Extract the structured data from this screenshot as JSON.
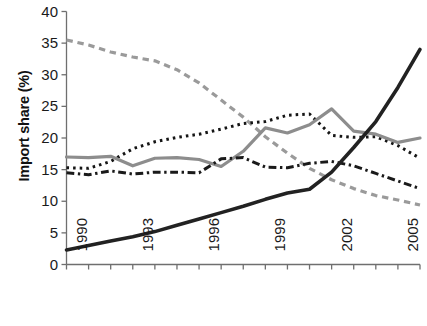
{
  "chart_data": {
    "type": "line",
    "title": "",
    "xlabel": "",
    "ylabel": "Import share (%)",
    "xlim": [
      1990,
      2006
    ],
    "ylim": [
      0,
      40
    ],
    "ytick_values": [
      0,
      5,
      10,
      15,
      20,
      25,
      30,
      35,
      40
    ],
    "ytick_labels": [
      "0",
      "5",
      "10",
      "15",
      "20",
      "25",
      "30",
      "35",
      "40"
    ],
    "xtick_values": [
      1990,
      1993,
      1996,
      1999,
      2002,
      2005
    ],
    "xtick_labels": [
      "1990",
      "1993",
      "1996",
      "1999",
      "2002",
      "2005"
    ],
    "grid": false,
    "legend": "none",
    "x": [
      1990,
      1991,
      1992,
      1993,
      1994,
      1995,
      1996,
      1997,
      1998,
      1999,
      2000,
      2001,
      2002,
      2003,
      2004,
      2005,
      2006
    ],
    "series": [
      {
        "name": "series-gray-dashed",
        "style": "dashed",
        "color": "#9a9a9a",
        "width": 3.2,
        "values": [
          35.5,
          34.7,
          33.6,
          32.8,
          32.2,
          30.8,
          28.7,
          26.0,
          23.3,
          20.2,
          17.6,
          15.2,
          13.4,
          12.0,
          10.9,
          10.2,
          9.4
        ]
      },
      {
        "name": "series-black-dotted",
        "style": "dotted",
        "color": "#151515",
        "width": 3.0,
        "values": [
          15.3,
          15.2,
          16.3,
          18.3,
          19.4,
          20.1,
          20.6,
          21.4,
          22.3,
          22.6,
          23.6,
          23.8,
          20.4,
          20.1,
          20.2,
          18.8,
          16.8
        ]
      },
      {
        "name": "series-gray-solid",
        "style": "solid",
        "color": "#8d8d8d",
        "width": 3.2,
        "values": [
          17.0,
          16.9,
          17.1,
          15.6,
          16.8,
          16.9,
          16.6,
          15.5,
          17.9,
          21.6,
          20.8,
          22.1,
          24.6,
          21.1,
          20.6,
          19.3,
          20.0
        ]
      },
      {
        "name": "series-black-dashdot",
        "style": "dashdot",
        "color": "#1a1a1a",
        "width": 3.0,
        "values": [
          14.5,
          14.2,
          14.8,
          14.3,
          14.6,
          14.6,
          14.5,
          16.7,
          16.9,
          15.4,
          15.3,
          16.0,
          16.3,
          15.6,
          14.4,
          13.2,
          12.0
        ]
      },
      {
        "name": "series-black-solid",
        "style": "solid",
        "color": "#222222",
        "width": 3.6,
        "values": [
          2.3,
          3.0,
          3.7,
          4.4,
          5.2,
          6.2,
          7.2,
          8.2,
          9.2,
          10.3,
          11.3,
          11.9,
          14.6,
          18.5,
          22.6,
          28.0,
          34.0
        ]
      }
    ]
  },
  "colors": {
    "axis": "#6f6f6f",
    "tick_text": "#1a1a1a",
    "background": "#ffffff"
  }
}
